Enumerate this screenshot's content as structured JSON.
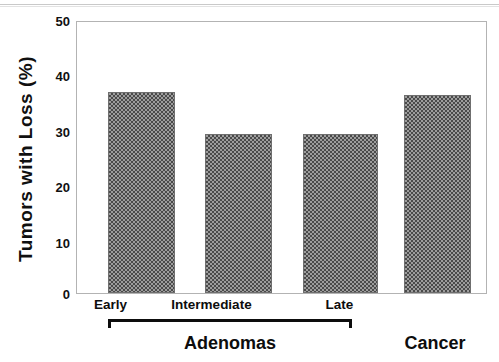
{
  "chart_data": {
    "type": "bar",
    "title": "",
    "xlabel": "",
    "ylabel": "Tumors with Loss (%)",
    "ylim": [
      0,
      50
    ],
    "yticks": [
      0,
      10,
      20,
      30,
      40,
      50
    ],
    "ytick_labels": [
      "0",
      "10",
      "20",
      "30",
      "40",
      "50"
    ],
    "grid": false,
    "legend": "none",
    "categories": [
      "Early",
      "Intermediate",
      "Late",
      "Cancer"
    ],
    "values": [
      37,
      29.3,
      29.3,
      36.5
    ],
    "groups": [
      {
        "label": "Adenomas",
        "categories": [
          "Early",
          "Intermediate",
          "Late"
        ],
        "bracket": true
      },
      {
        "label": "Cancer",
        "categories": [
          "Cancer"
        ],
        "bracket": false
      }
    ],
    "bar_fill": "#808080",
    "bar_pattern": "50-percent-checkerboard-dither",
    "axis_color": "#b3b3b3"
  },
  "axes": {
    "y_title": "Tumors with Loss (%)",
    "ticks": [
      {
        "value": 50,
        "label": "50",
        "mark": false
      },
      {
        "value": 40,
        "label": "40",
        "mark": true
      },
      {
        "value": 30,
        "label": "30",
        "mark": true
      },
      {
        "value": 20,
        "label": "20",
        "mark": true
      },
      {
        "value": 10,
        "label": "10",
        "mark": true
      },
      {
        "value": 0,
        "label": "0",
        "mark": false
      }
    ]
  },
  "bars": [
    {
      "label": "Early",
      "value": 37
    },
    {
      "label": "Intermediate",
      "value": 29.3
    },
    {
      "label": "Late",
      "value": 29.3
    },
    {
      "label": "Cancer",
      "value": 36.5
    }
  ],
  "groups": {
    "adenomas_label": "Adenomas",
    "cancer_label": "Cancer"
  }
}
